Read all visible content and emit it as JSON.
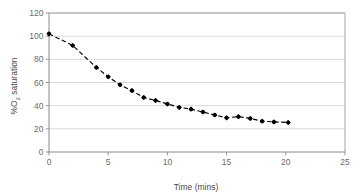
{
  "chart_data": {
    "type": "scatter",
    "title": "",
    "xlabel": "Time (mins)",
    "ylabel": "%O2 saturation",
    "ylabel_prefix": "%O",
    "ylabel_sub": "2",
    "ylabel_suffix": " saturation",
    "xlim": [
      0,
      25
    ],
    "ylim": [
      0,
      120
    ],
    "xticks": [
      0,
      5,
      10,
      15,
      20,
      25
    ],
    "yticks": [
      0,
      20,
      40,
      60,
      80,
      100,
      120
    ],
    "xtick_labels": [
      "0",
      "5",
      "10",
      "15",
      "20",
      "25"
    ],
    "ytick_labels": [
      "0",
      "20",
      "40",
      "60",
      "80",
      "100",
      "120"
    ],
    "grid": "horizontal",
    "legend": "none",
    "series": [
      {
        "name": "%O2 saturation",
        "marker": "diamond",
        "marker_color": "#000000",
        "line_style": "dashed",
        "line_color": "#000000",
        "x": [
          0,
          2,
          4,
          5,
          6,
          7,
          8,
          9,
          10,
          11,
          12,
          13,
          14,
          15,
          16,
          17,
          18,
          19,
          20.2
        ],
        "y": [
          102,
          92,
          73,
          65,
          58,
          53,
          47,
          44.5,
          41.5,
          38.5,
          37,
          34.5,
          32,
          29.5,
          30.5,
          29,
          26.5,
          26,
          25.5
        ]
      }
    ]
  },
  "colors": {
    "gridline": "#c9c9c9",
    "frame": "#9a9a9a",
    "axis": "#8a8a8a",
    "tick_text": "#6b6b6b",
    "axis_title": "#4a4a4a",
    "data": "#000000",
    "background": "#ffffff"
  }
}
